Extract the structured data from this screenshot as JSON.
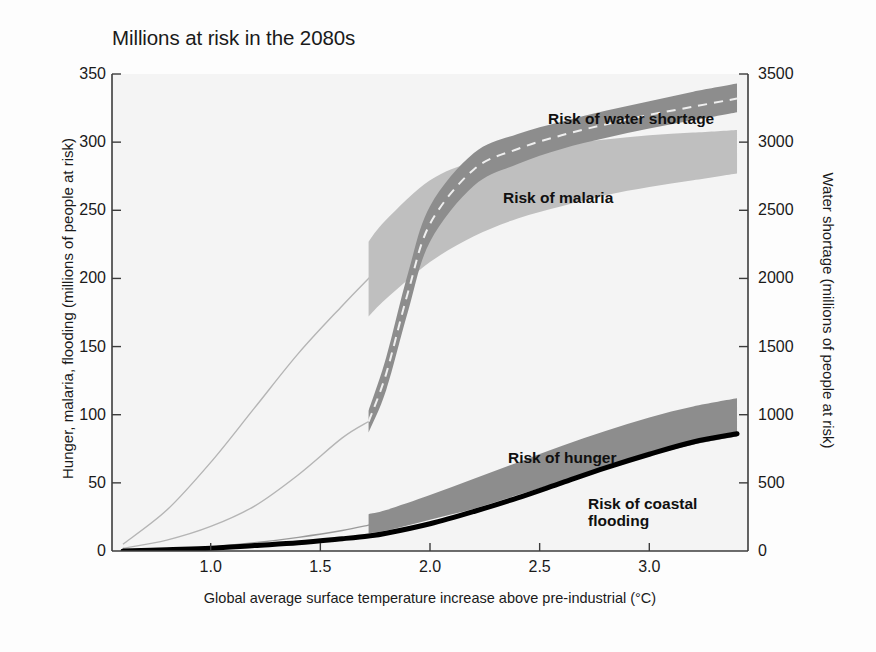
{
  "chart_data": {
    "type": "area",
    "title": "Millions at risk in the 2080s",
    "xlabel": "Global average surface temperature increase above pre-industrial (°C)",
    "ylabel_left": "Hunger, malaria, flooding (millions of people at risk)",
    "ylabel_right": "Water shortage (millions of people at risk)",
    "xlim": [
      0.55,
      3.45
    ],
    "xticks": [
      "1.0",
      "1.5",
      "2.0",
      "2.5",
      "3.0"
    ],
    "xtick_values": [
      1.0,
      1.5,
      2.0,
      2.5,
      3.0
    ],
    "ylim_left": [
      0,
      350
    ],
    "yticks_left": [
      "0",
      "50",
      "100",
      "150",
      "200",
      "250",
      "300",
      "350"
    ],
    "ytick_values_left": [
      0,
      50,
      100,
      150,
      200,
      250,
      300,
      350
    ],
    "ylim_right": [
      0,
      3500
    ],
    "yticks_right": [
      "0",
      "500",
      "1000",
      "1500",
      "2000",
      "2500",
      "3000",
      "3500"
    ],
    "ytick_values_right": [
      0,
      500,
      1000,
      1500,
      2000,
      2500,
      3000,
      3500
    ],
    "grid": false,
    "legend_position": "inline-annotations",
    "band_start_temperature": 1.72,
    "series": [
      {
        "name": "Risk of water shortage",
        "axis": "right",
        "units": "millions of people at risk (water shortage scale)",
        "color": "#8d8d8d",
        "has_dashed_center_line": true,
        "x": [
          0.6,
          0.8,
          1.0,
          1.2,
          1.4,
          1.6,
          1.72,
          1.8,
          1.9,
          2.0,
          2.2,
          2.4,
          2.6,
          2.8,
          3.0,
          3.2,
          3.4
        ],
        "center": [
          20,
          80,
          180,
          330,
          560,
          830,
          950,
          1300,
          1900,
          2400,
          2800,
          2950,
          3050,
          3130,
          3200,
          3260,
          3320
        ],
        "lower": [
          10,
          60,
          150,
          290,
          500,
          760,
          870,
          1180,
          1760,
          2270,
          2680,
          2840,
          2950,
          3030,
          3100,
          3160,
          3220
        ],
        "upper": [
          30,
          100,
          210,
          370,
          620,
          900,
          1030,
          1420,
          2040,
          2530,
          2920,
          3060,
          3150,
          3230,
          3300,
          3370,
          3430
        ]
      },
      {
        "name": "Risk of malaria",
        "axis": "left",
        "units": "millions of people at risk",
        "color": "#bfbfbf",
        "x": [
          0.6,
          0.8,
          1.0,
          1.2,
          1.4,
          1.6,
          1.72,
          1.8,
          2.0,
          2.2,
          2.4,
          2.6,
          2.8,
          3.0,
          3.2,
          3.4
        ],
        "center": [
          5,
          30,
          65,
          105,
          145,
          180,
          200,
          215,
          243,
          260,
          270,
          277,
          283,
          288,
          292,
          296
        ],
        "lower": [
          2,
          20,
          50,
          85,
          122,
          155,
          172,
          185,
          212,
          231,
          244,
          253,
          261,
          267,
          272,
          277
        ],
        "upper": [
          8,
          40,
          80,
          125,
          168,
          205,
          227,
          243,
          272,
          286,
          294,
          299,
          302,
          305,
          307,
          309
        ]
      },
      {
        "name": "Risk of hunger",
        "axis": "left",
        "units": "millions of people at risk",
        "color": "#8d8d8d",
        "x": [
          0.6,
          0.8,
          1.0,
          1.2,
          1.4,
          1.6,
          1.72,
          1.8,
          2.0,
          2.2,
          2.4,
          2.6,
          2.8,
          3.0,
          3.2,
          3.4
        ],
        "center": [
          0,
          1,
          3,
          6,
          10,
          15,
          19,
          22,
          31,
          41,
          52,
          63,
          74,
          84,
          93,
          100
        ],
        "lower": [
          0,
          0,
          1,
          3,
          6,
          10,
          13,
          15,
          23,
          31,
          41,
          51,
          61,
          70,
          78,
          84
        ],
        "upper": [
          0,
          2,
          5,
          9,
          15,
          22,
          27,
          30,
          41,
          53,
          65,
          77,
          88,
          98,
          106,
          112
        ]
      },
      {
        "name": "Risk of coastal flooding",
        "axis": "left",
        "units": "millions of people at risk",
        "color": "#000000",
        "style": "thick-line",
        "x": [
          0.6,
          0.8,
          1.0,
          1.2,
          1.4,
          1.6,
          1.72,
          1.8,
          2.0,
          2.2,
          2.4,
          2.6,
          2.8,
          3.0,
          3.2,
          3.4
        ],
        "values": [
          0,
          1,
          2,
          4,
          6,
          9,
          11,
          13,
          20,
          29,
          39,
          50,
          61,
          71,
          80,
          86
        ]
      }
    ]
  },
  "labels": {
    "water": "Risk of water shortage",
    "malaria": "Risk of malaria",
    "hunger": "Risk of hunger",
    "coastal": "Risk of coastal\nflooding"
  },
  "colors": {
    "water_band": "#8d8d8d",
    "malaria_band": "#bfbfbf",
    "hunger_band": "#8d8d8d",
    "coastal_line": "#000000",
    "axis": "#3c3c3c",
    "plot_background": "#f4f4f4",
    "text": "#1a1a1a"
  }
}
